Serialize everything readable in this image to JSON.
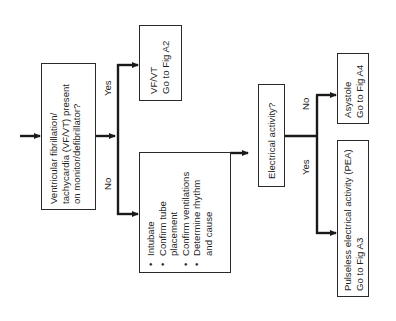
{
  "flowchart": {
    "start_node": {
      "lines": [
        "Ventricular fibrillation/",
        "tachycardia (VF/VT) present",
        "on monitor/defibrillator?"
      ]
    },
    "branch1": {
      "yes_label": "Yes",
      "no_label": "No"
    },
    "vfvt_node": {
      "lines": [
        "VF/VT",
        "Go to Fig A2"
      ]
    },
    "actions_node": {
      "items": [
        {
          "line1": "Intubate",
          "line2": ""
        },
        {
          "line1": "Confirm tube",
          "line2": "placement"
        },
        {
          "line1": "Confirm ventilations",
          "line2": ""
        },
        {
          "line1": "Determine rhythm",
          "line2": "and cause"
        }
      ]
    },
    "electrical_node": {
      "lines": [
        "Electrical activity?"
      ]
    },
    "branch2": {
      "no_label": "No",
      "yes_label": "Yes"
    },
    "asystole_node": {
      "lines": [
        "Asystole",
        "Go to Fig A4"
      ]
    },
    "pea_node": {
      "lines": [
        "Pulseless electrical activity (PEA)",
        "Go to Fig A3"
      ]
    }
  },
  "colors": {
    "line": "#1a1a1a",
    "box_border": "#2a2a2a",
    "background": "#ffffff"
  }
}
